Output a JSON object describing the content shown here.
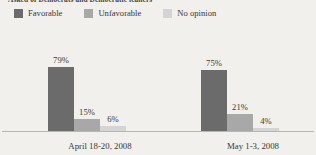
{
  "title": "Asked of Democrats and Democratic leaners",
  "legend": {
    "position": "top-left",
    "items": [
      {
        "label": "Favorable",
        "color": "#6b6b6b",
        "swatch_name": "legend-swatch-favorable"
      },
      {
        "label": "Unfavorable",
        "color": "#a8a8a8",
        "swatch_name": "legend-swatch-unfavorable"
      },
      {
        "label": "No opinion",
        "color": "#d4d4d4",
        "swatch_name": "legend-swatch-no-opinion"
      }
    ]
  },
  "chart_data": {
    "type": "bar",
    "title": "Asked of Democrats and Democratic leaners",
    "xlabel": "",
    "ylabel": "",
    "ylim": [
      0,
      100
    ],
    "grid": false,
    "legend_position": "top-left",
    "categories": [
      "April 18-20, 2008",
      "May 1-3, 2008"
    ],
    "series": [
      {
        "name": "Favorable",
        "color": "#6b6b6b",
        "values": [
          79,
          75
        ],
        "labels": [
          "79%",
          "75%"
        ]
      },
      {
        "name": "Unfavorable",
        "color": "#a8a8a8",
        "values": [
          15,
          21
        ],
        "labels": [
          "15%",
          "21%"
        ]
      },
      {
        "name": "No opinion",
        "color": "#d4d4d4",
        "values": [
          6,
          4
        ],
        "labels": [
          "6%",
          "4%"
        ]
      }
    ]
  }
}
